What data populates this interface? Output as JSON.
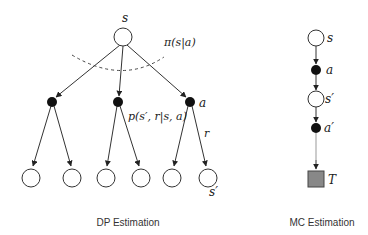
{
  "dp_diagram": {
    "caption": "DP Estimation",
    "root_label": "s",
    "policy_label": "π(s|a)",
    "action_label": "a",
    "transition_label": "p(s′, r|s, a)",
    "reward_label": "r",
    "next_state_label": "s′",
    "action_nodes": 3,
    "leaf_nodes": 6
  },
  "mc_diagram": {
    "caption": "MC Estimation",
    "state_label": "s",
    "action_label": "a",
    "next_state_label": "s′",
    "next_action_label": "a′",
    "terminal_label": "T"
  },
  "colors": {
    "stroke": "#333333",
    "action_fill": "#111111",
    "terminal_fill": "#888888",
    "dashed": "#444444"
  }
}
